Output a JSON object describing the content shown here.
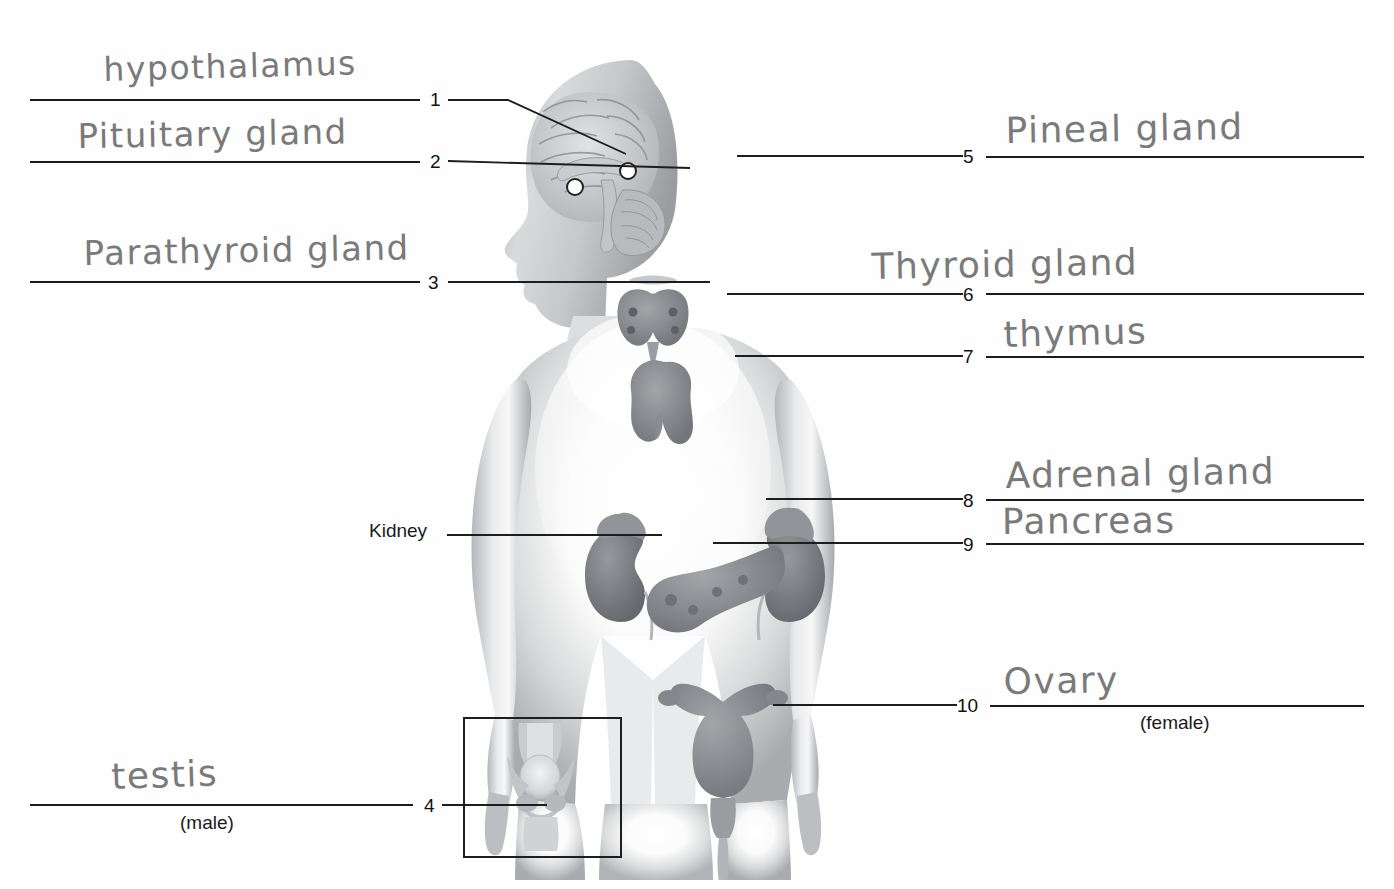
{
  "worksheet": {
    "title": "Endocrine System Labeling Worksheet",
    "subject": "human endocrine glands diagram"
  },
  "printed_labels": [
    {
      "id": "kidney",
      "text": "Kidney"
    },
    {
      "id": "male",
      "text": "(male)"
    },
    {
      "id": "female",
      "text": "(female)"
    }
  ],
  "items": [
    {
      "number": "1",
      "answer": "hypothalamus",
      "side": "left",
      "organ": "hypothalamus"
    },
    {
      "number": "2",
      "answer": "Pituitary gland",
      "side": "left",
      "organ": "pituitary-gland"
    },
    {
      "number": "3",
      "answer": "Parathyroid gland",
      "side": "left",
      "organ": "parathyroid-gland"
    },
    {
      "number": "4",
      "answer": "testis",
      "side": "left",
      "organ": "testis",
      "note": "(male)"
    },
    {
      "number": "5",
      "answer": "Pineal gland",
      "side": "right",
      "organ": "pineal-gland"
    },
    {
      "number": "6",
      "answer": "Thyroid gland",
      "side": "right",
      "organ": "thyroid-gland"
    },
    {
      "number": "7",
      "answer": "thymus",
      "side": "right",
      "organ": "thymus"
    },
    {
      "number": "8",
      "answer": "Adrenal gland",
      "side": "right",
      "organ": "adrenal-gland"
    },
    {
      "number": "9",
      "answer": "Pancreas",
      "side": "right",
      "organ": "pancreas"
    },
    {
      "number": "10",
      "answer": "Ovary",
      "side": "right",
      "organ": "ovary",
      "note": "(female)"
    }
  ],
  "colors": {
    "ink": "#1b1b1b",
    "pencil": "#8d8d8d",
    "paper": "#fefefe",
    "organ": "#8d8f92"
  }
}
